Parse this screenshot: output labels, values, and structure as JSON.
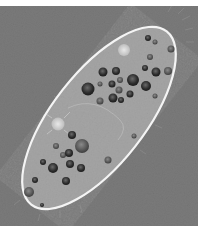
{
  "image": {
    "subject": "paramecium micrograph",
    "width": 198,
    "height": 232,
    "colors": {
      "background": "#7b7b7b",
      "cell_body": "#a9a9a9",
      "membrane": "#f4f4f4",
      "vacuole_dark": "#2e2e2e",
      "vacuole_mid": "#5a5a5a",
      "contractile_vacuole": "#d6d6d6",
      "border": "#ffffff"
    }
  }
}
